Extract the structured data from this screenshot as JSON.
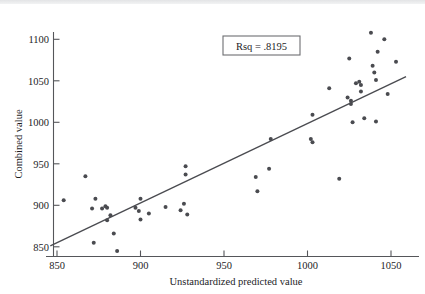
{
  "chart_data": {
    "type": "scatter",
    "title": "",
    "xlabel": "Unstandardized predicted value",
    "ylabel": "Combined value",
    "xlim": [
      846,
      1062
    ],
    "ylim": [
      838,
      1115
    ],
    "xticks": [
      850,
      900,
      950,
      1000,
      1050
    ],
    "xtick_labels": [
      "850",
      "900",
      "950",
      "1000",
      "1050"
    ],
    "yticks": [
      850,
      900,
      950,
      1000,
      1050,
      1100
    ],
    "ytick_labels": [
      "850",
      "900",
      "950",
      "1000",
      "1050",
      "1100"
    ],
    "grid": false,
    "legend": null,
    "annotations": [
      {
        "name": "rsq-annotation",
        "text": "Rsq = .8195",
        "x": 968,
        "y": 1090,
        "boxed": true
      }
    ],
    "series": [
      {
        "name": "observations",
        "marker": "circle",
        "color": "#4a4b50",
        "points": [
          [
            854,
            906
          ],
          [
            867,
            935
          ],
          [
            871,
            896
          ],
          [
            872,
            855
          ],
          [
            873,
            908
          ],
          [
            877,
            896
          ],
          [
            879,
            899
          ],
          [
            880,
            897
          ],
          [
            880,
            882
          ],
          [
            882,
            888
          ],
          [
            884,
            866
          ],
          [
            886,
            845
          ],
          [
            897,
            897
          ],
          [
            899,
            893
          ],
          [
            900,
            908
          ],
          [
            900,
            883
          ],
          [
            905,
            890
          ],
          [
            915,
            898
          ],
          [
            924,
            894
          ],
          [
            926,
            902
          ],
          [
            927,
            947
          ],
          [
            927,
            937
          ],
          [
            928,
            889
          ],
          [
            969,
            934
          ],
          [
            970,
            917
          ],
          [
            977,
            944
          ],
          [
            978,
            980
          ],
          [
            1002,
            980
          ],
          [
            1003,
            976
          ],
          [
            1003,
            1009
          ],
          [
            1013,
            1041
          ],
          [
            1019,
            932
          ],
          [
            1024,
            1030
          ],
          [
            1025,
            1077
          ],
          [
            1026,
            1026
          ],
          [
            1026,
            1022
          ],
          [
            1027,
            1000
          ],
          [
            1029,
            1047
          ],
          [
            1031,
            1049
          ],
          [
            1032,
            1045
          ],
          [
            1032,
            1037
          ],
          [
            1034,
            1005
          ],
          [
            1038,
            1108
          ],
          [
            1039,
            1068
          ],
          [
            1040,
            1060
          ],
          [
            1041,
            1051
          ],
          [
            1041,
            1001
          ],
          [
            1042,
            1085
          ],
          [
            1046,
            1100
          ],
          [
            1048,
            1034
          ],
          [
            1053,
            1073
          ]
        ]
      }
    ],
    "fit_line": {
      "name": "regression-line",
      "color": "#4a4b50",
      "x_start": 846,
      "y_start": 851,
      "x_end": 1059,
      "y_end": 1055
    }
  }
}
